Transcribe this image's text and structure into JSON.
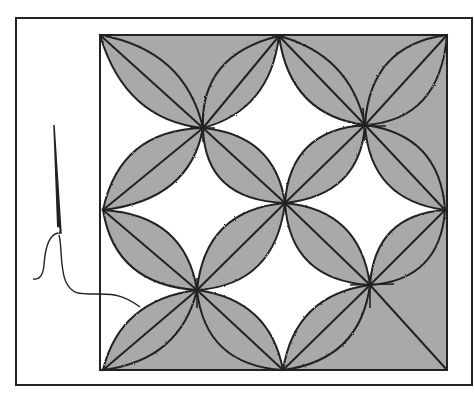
{
  "figure": {
    "colors": {
      "background": "#ffffff",
      "shade": "#a9a9a9",
      "line": "#222222"
    },
    "frame": {
      "x": 16,
      "y": 18,
      "width": 456,
      "height": 367
    },
    "block": {
      "x": 100,
      "y": 35,
      "width": 347,
      "height": 335
    },
    "nodes": {
      "top_left": [
        100,
        35
      ],
      "top_mid": [
        279,
        36
      ],
      "top_right": [
        447,
        35
      ],
      "mid_left": [
        103,
        210
      ],
      "center": [
        285,
        203
      ],
      "mid_right": [
        445,
        210
      ],
      "bottom_left": [
        103,
        370
      ],
      "bottom_mid": [
        283,
        370
      ],
      "bottom_right": [
        447,
        370
      ],
      "upper_left_star": [
        203,
        128
      ],
      "upper_right_star": [
        365,
        125
      ],
      "lower_left_star": [
        197,
        290
      ],
      "lower_right_star": [
        370,
        285
      ]
    },
    "needle": {
      "tip": [
        54,
        125
      ],
      "eye": [
        58,
        233
      ]
    }
  }
}
